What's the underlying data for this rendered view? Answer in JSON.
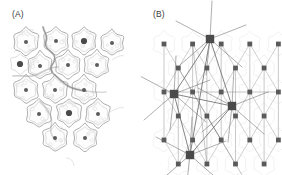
{
  "figure": {
    "background_color": "#ffffff",
    "width": 282,
    "height": 175,
    "panels": [
      {
        "id": "A",
        "label": "(A)",
        "caption_text": "(A)",
        "type": "cell-tissue-micrograph",
        "description_icon": "plant-cell-tissue-icon"
      },
      {
        "id": "B",
        "label": "(B)",
        "caption_text": "(B)",
        "type": "lattice-network-graph",
        "description_icon": "triangular-lattice-icon"
      }
    ]
  },
  "colors": {
    "label_text": "#3a3a3a",
    "cell_outline": "#8d8d8d",
    "cell_fill": "#fdfdfd",
    "cell_inner_speckle": "#e3e3e3",
    "cell_wall_thick": "#9a9a9a",
    "nucleus_normal": "#5c5c5c",
    "nucleus_marked": "#4a4a4a",
    "lattice_line_light": "#c9c9c9",
    "lattice_line_dark": "#6f6f6f",
    "lattice_node_small": "#5a5a5a",
    "lattice_node_large": "#4a4a4a",
    "ghost_cell": "#ededed"
  },
  "chart_data": {
    "type": "scatter",
    "title": "",
    "xlabel": "",
    "ylabel": "",
    "panel_a": {
      "type": "cell-map",
      "note": "Flower/star shaped cells with central nuclei; thick wall segments separate cell groups",
      "cells": [
        {
          "cx": 26,
          "cy": 42,
          "r": 15,
          "marked": false
        },
        {
          "cx": 56,
          "cy": 41,
          "r": 15,
          "marked": false
        },
        {
          "cx": 84,
          "cy": 41,
          "r": 15,
          "marked": true
        },
        {
          "cx": 112,
          "cy": 43,
          "r": 14,
          "marked": false
        },
        {
          "cx": 40,
          "cy": 66,
          "r": 15,
          "marked": false
        },
        {
          "cx": 68,
          "cy": 65,
          "r": 15,
          "marked": false
        },
        {
          "cx": 97,
          "cy": 65,
          "r": 15,
          "marked": false
        },
        {
          "cx": 26,
          "cy": 90,
          "r": 15,
          "marked": false
        },
        {
          "cx": 55,
          "cy": 90,
          "r": 15,
          "marked": false
        },
        {
          "cx": 84,
          "cy": 90,
          "r": 15,
          "marked": false
        },
        {
          "cx": 39,
          "cy": 114,
          "r": 15,
          "marked": false
        },
        {
          "cx": 69,
          "cy": 113,
          "r": 15,
          "marked": true
        },
        {
          "cx": 98,
          "cy": 114,
          "r": 15,
          "marked": false
        },
        {
          "cx": 55,
          "cy": 138,
          "r": 15,
          "marked": false
        },
        {
          "cx": 85,
          "cy": 138,
          "r": 15,
          "marked": false
        }
      ],
      "free_nuclei": [
        {
          "cx": 20,
          "cy": 64,
          "marked": true
        }
      ],
      "nucleus_radius_normal": 2.0,
      "nucleus_radius_marked": 3.1
    },
    "panel_b": {
      "type": "graph",
      "note": "Triangular lattice of small nodes; four large nodes joined by long chords",
      "lattice_rows": 7,
      "lattice_cols": 6,
      "nodes_small": [
        {
          "x": 37,
          "y": 68
        },
        {
          "x": 65,
          "y": 68
        },
        {
          "x": 94,
          "y": 68
        },
        {
          "x": 23,
          "y": 92
        },
        {
          "x": 51,
          "y": 92
        },
        {
          "x": 80,
          "y": 92
        },
        {
          "x": 108,
          "y": 92
        },
        {
          "x": 37,
          "y": 116
        },
        {
          "x": 66,
          "y": 116
        },
        {
          "x": 94,
          "y": 116
        },
        {
          "x": 23,
          "y": 140
        },
        {
          "x": 51,
          "y": 140
        },
        {
          "x": 80,
          "y": 140
        },
        {
          "x": 108,
          "y": 140
        },
        {
          "x": 66,
          "y": 44
        },
        {
          "x": 38,
          "y": 164
        },
        {
          "x": 95,
          "y": 164
        }
      ],
      "nodes_large": [
        {
          "x": 69,
          "y": 39,
          "label": "top"
        },
        {
          "x": 33,
          "y": 94,
          "label": "left"
        },
        {
          "x": 91,
          "y": 106,
          "label": "right"
        },
        {
          "x": 49,
          "y": 155,
          "label": "bottom"
        }
      ],
      "chords": [
        {
          "from": "top",
          "to": "left"
        },
        {
          "from": "top",
          "to": "right"
        },
        {
          "from": "left",
          "to": "right"
        },
        {
          "from": "left",
          "to": "bottom"
        },
        {
          "from": "right",
          "to": "bottom"
        },
        {
          "from": "top",
          "to": "bottom"
        }
      ],
      "node_size_small": 2.4,
      "node_size_large": 4.2
    }
  }
}
